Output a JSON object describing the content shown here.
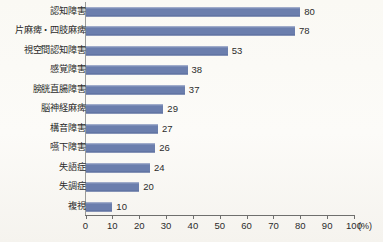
{
  "chart_data": {
    "type": "bar",
    "orientation": "horizontal",
    "title": "",
    "xlabel": "(%)",
    "ylabel": "",
    "xlim": [
      0,
      100
    ],
    "grid": false,
    "legend": null,
    "unit_label": "(%)",
    "bar_color": "#6b7ead",
    "axis_color": "#6f6f6d",
    "background_color": "#fbfaf7",
    "categories": [
      "認知障害",
      "片麻痺・四肢麻痺",
      "視空間認知障害",
      "感覚障害",
      "膀胱直腸障害",
      "脳神経麻痺",
      "構音障害",
      "嚥下障害",
      "失語症",
      "失調症",
      "複視"
    ],
    "values": [
      80,
      78,
      53,
      38,
      37,
      29,
      27,
      26,
      24,
      20,
      10
    ],
    "data_labels": [
      "80",
      "78",
      "53",
      "38",
      "37",
      "29",
      "27",
      "26",
      "24",
      "20",
      "10"
    ],
    "xticks": [
      0,
      10,
      20,
      30,
      40,
      50,
      60,
      70,
      80,
      90,
      100
    ],
    "xtick_labels": [
      "0",
      "10",
      "20",
      "30",
      "40",
      "50",
      "60",
      "70",
      "80",
      "90",
      "100"
    ]
  }
}
